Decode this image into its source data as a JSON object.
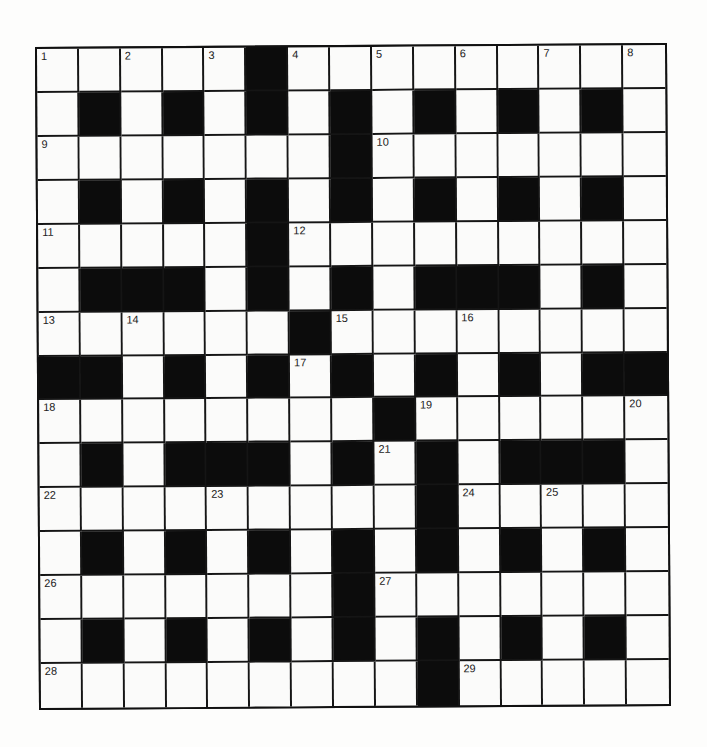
{
  "puzzle": {
    "rows": 15,
    "cols": 15,
    "colors": {
      "block": "#0c0c0c",
      "cell": "#fbfbfa",
      "line": "#151515"
    },
    "grid": [
      "11111011111111",
      "1010101010101010"
    ],
    "layout": [
      "WWWWWBWWWWWWWWW",
      "WBWBWBWBWBWBWBW",
      "WWWWWWWBWWWWWWW",
      "WBWBWBWBWBWBWBW",
      "WWWWWBWWWWWWWWW",
      "WBBBWBWBWBBBWBW",
      "WWWWWWBWWWWWWWW",
      "BBWBWBWBWBWBWBB",
      "WWWWWWWWBWWWWWW",
      "WBWBBBWBWBWBBBW",
      "WWWWWWWWWBWWWWW",
      "WBWBWBWBWBWBWBW",
      "WWWWWWWBWWWWWWW",
      "WBWBWBWBWBWBWBW",
      "WWWWWWWWWBWWWWW"
    ],
    "numbers": [
      {
        "n": "1",
        "r": 0,
        "c": 0
      },
      {
        "n": "2",
        "r": 0,
        "c": 2
      },
      {
        "n": "3",
        "r": 0,
        "c": 4
      },
      {
        "n": "4",
        "r": 0,
        "c": 6
      },
      {
        "n": "5",
        "r": 0,
        "c": 8
      },
      {
        "n": "6",
        "r": 0,
        "c": 10
      },
      {
        "n": "7",
        "r": 0,
        "c": 12
      },
      {
        "n": "8",
        "r": 0,
        "c": 14
      },
      {
        "n": "9",
        "r": 2,
        "c": 0
      },
      {
        "n": "10",
        "r": 2,
        "c": 8
      },
      {
        "n": "11",
        "r": 4,
        "c": 0
      },
      {
        "n": "12",
        "r": 4,
        "c": 6
      },
      {
        "n": "13",
        "r": 6,
        "c": 0
      },
      {
        "n": "14",
        "r": 6,
        "c": 2
      },
      {
        "n": "15",
        "r": 6,
        "c": 7
      },
      {
        "n": "16",
        "r": 6,
        "c": 10
      },
      {
        "n": "17",
        "r": 7,
        "c": 6
      },
      {
        "n": "18",
        "r": 8,
        "c": 0
      },
      {
        "n": "19",
        "r": 8,
        "c": 9
      },
      {
        "n": "20",
        "r": 8,
        "c": 14
      },
      {
        "n": "21",
        "r": 9,
        "c": 8
      },
      {
        "n": "22",
        "r": 10,
        "c": 0
      },
      {
        "n": "23",
        "r": 10,
        "c": 4
      },
      {
        "n": "24",
        "r": 10,
        "c": 10
      },
      {
        "n": "25",
        "r": 10,
        "c": 12
      },
      {
        "n": "26",
        "r": 12,
        "c": 0
      },
      {
        "n": "27",
        "r": 12,
        "c": 8
      },
      {
        "n": "28",
        "r": 14,
        "c": 0
      },
      {
        "n": "29",
        "r": 14,
        "c": 10
      }
    ]
  }
}
